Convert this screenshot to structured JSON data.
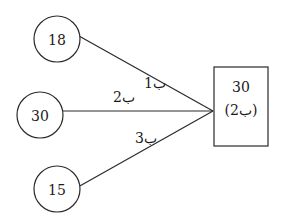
{
  "diagram": {
    "colors": {
      "stroke": "#2a2a2a",
      "text": "#1a1a1a",
      "background": "#ffffff"
    },
    "nodes": [
      {
        "id": "n1",
        "label": "18",
        "cx": 57,
        "cy": 39,
        "r": 23
      },
      {
        "id": "n2",
        "label": "30",
        "cx": 40,
        "cy": 115,
        "r": 23
      },
      {
        "id": "n3",
        "label": "15",
        "cx": 57,
        "cy": 189,
        "r": 23
      }
    ],
    "edges": [
      {
        "from": "n1",
        "label": "ب1",
        "x1": 79,
        "y1": 36,
        "x2": 213,
        "y2": 111,
        "lx": 144,
        "ly": 88
      },
      {
        "from": "n2",
        "label": "ب2",
        "x1": 63,
        "y1": 111,
        "x2": 213,
        "y2": 111,
        "lx": 113,
        "ly": 102
      },
      {
        "from": "n3",
        "label": "ب3",
        "x1": 78,
        "y1": 187,
        "x2": 213,
        "y2": 111,
        "lx": 135,
        "ly": 143
      }
    ],
    "target_box": {
      "x": 214,
      "y": 67,
      "width": 54,
      "height": 79,
      "value": "30",
      "sublabel": "(ب2)"
    }
  }
}
